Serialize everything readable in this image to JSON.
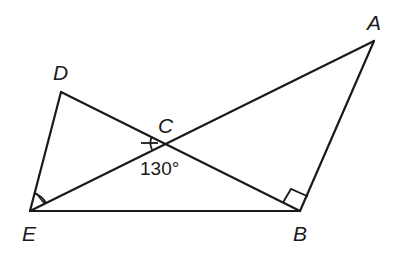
{
  "diagram": {
    "type": "geometry",
    "points": {
      "A": {
        "label": "A",
        "x": 374,
        "y": 41
      },
      "B": {
        "label": "B",
        "x": 300,
        "y": 211
      },
      "C": {
        "label": "C",
        "x": 165,
        "y": 143
      },
      "D": {
        "label": "D",
        "x": 61,
        "y": 92
      },
      "E": {
        "label": "E",
        "x": 30,
        "y": 211
      }
    },
    "segments": [
      "D-E",
      "D-B",
      "E-A",
      "E-B",
      "A-B"
    ],
    "angle_annotation": {
      "text": "130°",
      "at": "C"
    },
    "marks": {
      "equal_angle_C": "tick arc at angle DCE",
      "equal_angle_E": "tick arc at angle DEC",
      "right_angle": "at B (angle EBA)"
    },
    "colors": {
      "stroke": "#1a1a1a",
      "background": "#ffffff"
    }
  }
}
